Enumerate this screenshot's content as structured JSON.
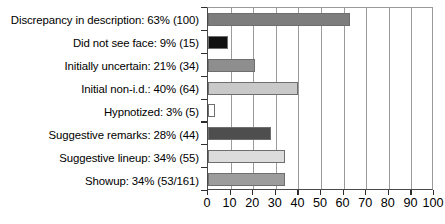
{
  "chart_data": {
    "type": "bar",
    "orientation": "horizontal",
    "title": "",
    "subtitle": "",
    "xlabel": "",
    "ylabel": "",
    "xlim": [
      0,
      100
    ],
    "ylim": null,
    "grid": true,
    "legend": null,
    "xticks": [
      "0",
      "10",
      "20",
      "30",
      "40",
      "50",
      "60",
      "70",
      "80",
      "90",
      "100"
    ],
    "xtick_values": [
      0,
      10,
      20,
      30,
      40,
      50,
      60,
      70,
      80,
      90,
      100
    ],
    "categories": [
      "Discrepancy in description: 63% (100)",
      "Did not see face: 9% (15)",
      "Initially uncertain: 21% (34)",
      "Initial non-i.d.: 40% (64)",
      "Hypnotized: 3% (5)",
      "Suggestive remarks: 28% (44)",
      "Suggestive lineup: 34% (55)",
      "Showup: 34% (53/161)"
    ],
    "values": [
      100,
      15,
      34,
      64,
      5,
      44,
      55,
      53
    ],
    "percent_values": [
      63,
      9,
      21,
      40,
      3,
      28,
      34,
      34
    ],
    "bar_colors": [
      "#7d7d7d",
      "#111111",
      "#8e8e8e",
      "#c9c9c9",
      "#ffffff",
      "#4e4e4e",
      "#dcdcdc",
      "#9c9c9c"
    ],
    "bar_edge_color": "#6e6e6e",
    "gridline_color": "#9b9b9b",
    "axis_color": "#2e2e2e",
    "background_color": "#ffffff"
  }
}
